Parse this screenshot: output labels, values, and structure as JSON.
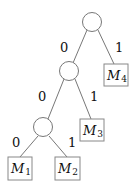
{
  "diagram": {
    "type": "binary-tree",
    "edge_labels": {
      "root_left": "0",
      "root_right": "1",
      "n1_left": "0",
      "n1_right": "1",
      "n2_left": "0",
      "n2_right": "1"
    },
    "leaves": {
      "m4": {
        "name": "M",
        "sub": "4"
      },
      "m3": {
        "name": "M",
        "sub": "3"
      },
      "m1": {
        "name": "M",
        "sub": "1"
      },
      "m2": {
        "name": "M",
        "sub": "2"
      }
    }
  }
}
